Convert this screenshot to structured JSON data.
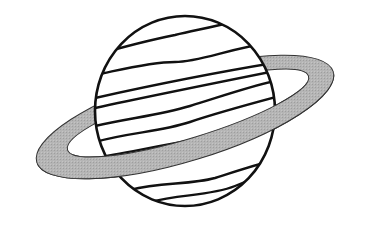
{
  "figure": {
    "subject": "planet with ring (Saturn) line drawing",
    "colors": {
      "background": "#ffffff",
      "outline": "#111111",
      "ring_fill": "#b3b3b3",
      "planet_fill": "#ffffff"
    },
    "planet": {
      "cx": 185,
      "cy": 111,
      "rx": 91,
      "ry": 96,
      "band_count": 9
    },
    "ring": {
      "cx": 185,
      "cy": 117,
      "rx": 155,
      "ry": 44,
      "inner_rx": 125,
      "inner_ry": 26,
      "tilt_deg": -17
    }
  }
}
